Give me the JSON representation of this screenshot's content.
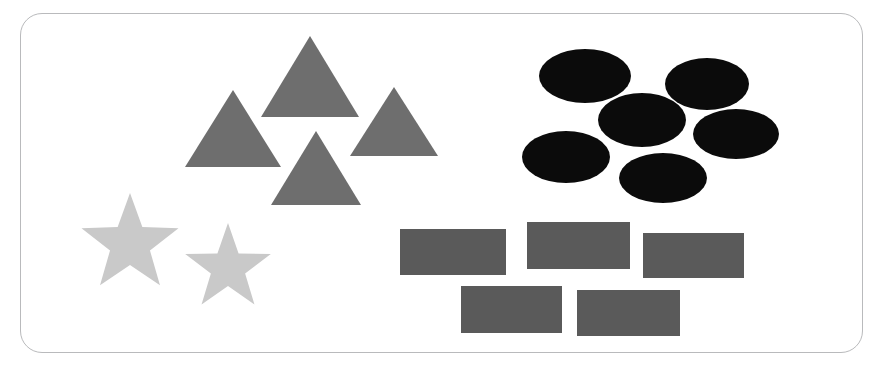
{
  "canvas": {
    "width": 880,
    "height": 373,
    "background": "#ffffff"
  },
  "frame": {
    "label": "rounded-rectangle-border",
    "x": 20,
    "y": 13,
    "width": 843,
    "height": 340,
    "radius": 22,
    "stroke": "#b9babc",
    "stroke_width": 1.2,
    "fill": "#ffffff"
  },
  "palette": {
    "triangle_gray": "#6e6e6e",
    "star_light_gray": "#c9c9c9",
    "ellipse_black": "#0b0b0b",
    "rectangle_dark_gray": "#5a5a5a",
    "border_gray": "#b9babc",
    "background_white": "#ffffff"
  },
  "groups": [
    {
      "name": "triangles",
      "shape_type": "triangle",
      "count": 4,
      "color": "#6e6e6e",
      "quadrant": "upper-left"
    },
    {
      "name": "stars",
      "shape_type": "star",
      "count": 2,
      "color": "#c9c9c9",
      "quadrant": "lower-left"
    },
    {
      "name": "ellipses",
      "shape_type": "ellipse",
      "count": 6,
      "color": "#0b0b0b",
      "quadrant": "upper-right"
    },
    {
      "name": "rectangles",
      "shape_type": "rectangle",
      "count": 5,
      "color": "#5a5a5a",
      "quadrant": "lower-right"
    }
  ],
  "triangles": [
    {
      "id": "triangle-top",
      "apex_x": 310,
      "apex_y": 36,
      "base_y": 117,
      "half_width": 49
    },
    {
      "id": "triangle-left",
      "apex_x": 233,
      "apex_y": 90,
      "base_y": 167,
      "half_width": 48
    },
    {
      "id": "triangle-right",
      "apex_x": 394,
      "apex_y": 87,
      "base_y": 156,
      "half_width": 44
    },
    {
      "id": "triangle-bottom",
      "apex_x": 316,
      "apex_y": 131,
      "base_y": 205,
      "half_width": 45
    }
  ],
  "stars": [
    {
      "id": "star-left",
      "cx": 130,
      "cy": 244,
      "outer_r": 51,
      "inner_r": 21,
      "rotation": 0
    },
    {
      "id": "star-right",
      "cx": 228,
      "cy": 268,
      "outer_r": 45,
      "inner_r": 18,
      "rotation": 0
    }
  ],
  "ellipses": [
    {
      "id": "ellipse-top-left",
      "cx": 585,
      "cy": 76,
      "rx": 46,
      "ry": 27
    },
    {
      "id": "ellipse-top-right",
      "cx": 707,
      "cy": 84,
      "rx": 42,
      "ry": 26
    },
    {
      "id": "ellipse-middle",
      "cx": 642,
      "cy": 120,
      "rx": 44,
      "ry": 27
    },
    {
      "id": "ellipse-right",
      "cx": 736,
      "cy": 134,
      "rx": 43,
      "ry": 25
    },
    {
      "id": "ellipse-bottom-left",
      "cx": 566,
      "cy": 157,
      "rx": 44,
      "ry": 26
    },
    {
      "id": "ellipse-bottom-mid",
      "cx": 663,
      "cy": 178,
      "rx": 44,
      "ry": 25
    }
  ],
  "rectangles": [
    {
      "id": "rect-top-left",
      "x": 400,
      "y": 229,
      "width": 106,
      "height": 46
    },
    {
      "id": "rect-top-center",
      "x": 527,
      "y": 222,
      "width": 103,
      "height": 47
    },
    {
      "id": "rect-top-right",
      "x": 643,
      "y": 233,
      "width": 101,
      "height": 45
    },
    {
      "id": "rect-bottom-left",
      "x": 461,
      "y": 286,
      "width": 101,
      "height": 47
    },
    {
      "id": "rect-bottom-right",
      "x": 577,
      "y": 290,
      "width": 103,
      "height": 46
    }
  ]
}
